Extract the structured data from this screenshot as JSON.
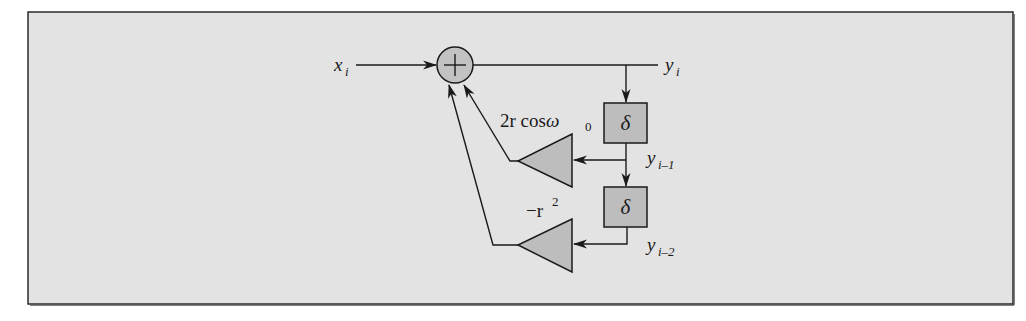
{
  "diagram": {
    "type": "signal-flow block diagram",
    "title": "",
    "colors": {
      "panel_background": "#e3e3e3",
      "panel_border": "#2b2b2b",
      "block_fill": "#bdbdbd",
      "line": "#1a1a1a"
    },
    "nodes": [
      {
        "id": "input",
        "kind": "signal",
        "label": "x",
        "subscript": "i"
      },
      {
        "id": "adder",
        "kind": "summing-junction",
        "symbol": "+"
      },
      {
        "id": "output",
        "kind": "signal",
        "label": "y",
        "subscript": "i"
      },
      {
        "id": "delay1",
        "kind": "delay",
        "symbol": "δ"
      },
      {
        "id": "tap1",
        "kind": "signal",
        "label": "y",
        "subscript": "i–1"
      },
      {
        "id": "delay2",
        "kind": "delay",
        "symbol": "δ"
      },
      {
        "id": "tap2",
        "kind": "signal",
        "label": "y",
        "subscript": "i–2"
      },
      {
        "id": "gain1",
        "kind": "gain",
        "label": "2r cosω",
        "label_sub": "0"
      },
      {
        "id": "gain2",
        "kind": "gain",
        "label": "−r",
        "label_sup": "2"
      }
    ],
    "edges": [
      {
        "from": "input",
        "to": "adder"
      },
      {
        "from": "adder",
        "to": "output"
      },
      {
        "from": "output",
        "to": "delay1"
      },
      {
        "from": "delay1",
        "to": "delay2"
      },
      {
        "from": "delay1",
        "to": "gain1"
      },
      {
        "from": "delay2",
        "to": "gain2"
      },
      {
        "from": "gain1",
        "to": "adder"
      },
      {
        "from": "gain2",
        "to": "adder"
      }
    ]
  },
  "labels": {
    "input_var": "x",
    "input_sub": "i",
    "adder_symbol": "+",
    "output_var": "y",
    "output_sub": "i",
    "delay1_symbol": "δ",
    "delay2_symbol": "δ",
    "tap1_var": "y",
    "tap1_sub": "i–1",
    "tap2_var": "y",
    "tap2_sub": "i–2",
    "gain1_coef": "2r cos",
    "gain1_omega": "ω",
    "gain1_omega_sub": "0",
    "gain2_coef": "−r",
    "gain2_sup": "2"
  }
}
